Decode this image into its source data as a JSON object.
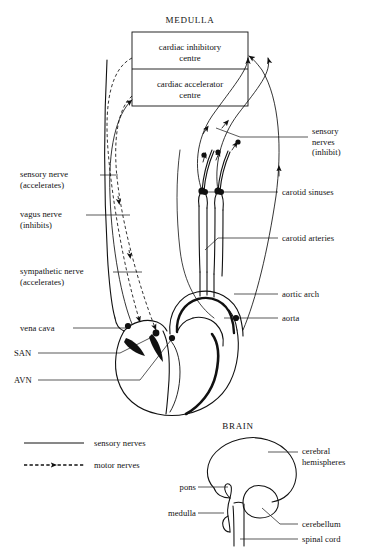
{
  "figure": {
    "medulla_title": "MEDULLA",
    "brain_title": "BRAIN"
  },
  "medulla_box": {
    "inhibitory_centre": "cardiac inhibitory\ncentre",
    "accelerator_centre": "cardiac accelerator\ncentre"
  },
  "left_labels": [
    {
      "id": "sensory-nerve-accelerates",
      "text": "sensory nerve\n(accelerates)"
    },
    {
      "id": "vagus-nerve-inhibits",
      "text": "vagus nerve\n(inhibits)"
    },
    {
      "id": "sympathetic-nerve-accelerates",
      "text": "sympathetic nerve\n(accelerates)"
    },
    {
      "id": "vena-cava",
      "text": "vena cava"
    },
    {
      "id": "san",
      "text": "SAN"
    },
    {
      "id": "avn",
      "text": "AVN"
    }
  ],
  "right_labels": [
    {
      "id": "sensory-nerves-inhibit",
      "text": "sensory\nnerves\n(inhibit)"
    },
    {
      "id": "carotid-sinuses",
      "text": "carotid sinuses"
    },
    {
      "id": "carotid-arteries",
      "text": "carotid arteries"
    },
    {
      "id": "aortic-arch",
      "text": "aortic arch"
    },
    {
      "id": "aorta",
      "text": "aorta"
    }
  ],
  "legend": {
    "sensory": "sensory nerves",
    "motor": "motor nerves"
  },
  "brain_labels": [
    {
      "id": "cerebral-hemispheres",
      "text": "cerebral\nhemispheres"
    },
    {
      "id": "pons",
      "text": "pons"
    },
    {
      "id": "medulla",
      "text": "medulla"
    },
    {
      "id": "cerebellum",
      "text": "cerebellum"
    },
    {
      "id": "spinal-cord",
      "text": "spinal cord"
    }
  ],
  "colors": {
    "ink": "#111111",
    "background": "#ffffff"
  }
}
